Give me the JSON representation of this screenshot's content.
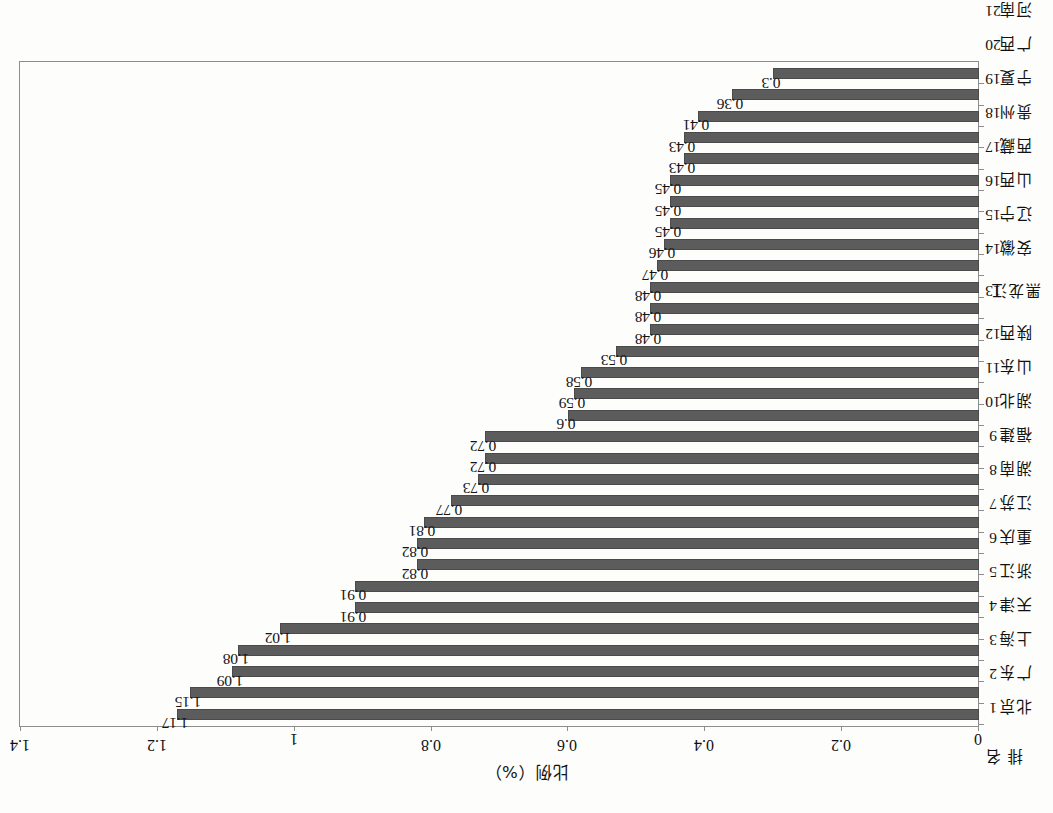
{
  "chart_data": {
    "type": "bar",
    "title": "",
    "xlabel": "",
    "ylabel": "比例（%）",
    "ylim": [
      0,
      1.4
    ],
    "ytick_labels": [
      "0",
      "0.2",
      "0.4",
      "0.6",
      "0.8",
      "1",
      "1.2",
      "1.4"
    ],
    "ytick_values": [
      0,
      0.2,
      0.4,
      0.6,
      0.8,
      1,
      1.2,
      1.4
    ],
    "grid": false,
    "legend": null,
    "orientation": "vertical-bars-on-rotated-page",
    "bar_color": "#5c5c5c",
    "rank_header": "排 名",
    "categories": [
      "北京",
      "广东",
      "上海",
      "天津",
      "浙江",
      "重庆",
      "江苏",
      "湖南",
      "福建",
      "湖北",
      "山东",
      "陕西",
      "黑龙江",
      "安徽",
      "辽宁",
      "山西",
      "西藏",
      "贵州",
      "宁夏",
      "广西",
      "河南",
      "内蒙古",
      "海南",
      "河北",
      "四川",
      "青海",
      "甘肃",
      "云南",
      "江西",
      "新疆",
      "吉林"
    ],
    "ranks": [
      "1",
      "2",
      "3",
      "4",
      "5",
      "6",
      "7",
      "8",
      "9",
      "10",
      "11",
      "12",
      "13",
      "14",
      "15",
      "16",
      "17",
      "18",
      "19",
      "20",
      "21",
      "22",
      "23",
      "24",
      "25",
      "26",
      "27",
      "28",
      "29",
      "30",
      "31"
    ],
    "values": [
      1.17,
      1.15,
      1.09,
      1.08,
      1.02,
      0.91,
      0.91,
      0.82,
      0.82,
      0.81,
      0.77,
      0.73,
      0.72,
      0.72,
      0.6,
      0.59,
      0.58,
      0.53,
      0.48,
      0.48,
      0.48,
      0.47,
      0.46,
      0.45,
      0.45,
      0.45,
      0.43,
      0.43,
      0.41,
      0.36,
      0.3
    ],
    "value_labels": [
      "1.17",
      "1.15",
      "1.09",
      "1.08",
      "1.02",
      "0.91",
      "0.91",
      "0.82",
      "0.82",
      "0.81",
      "0.77",
      "0.73",
      "0.72",
      "0.72",
      "0.6",
      "0.59",
      "0.58",
      "0.53",
      "0.48",
      "0.48",
      "0.48",
      "0.47",
      "0.46",
      "0.45",
      "0.45",
      "0.45",
      "0.43",
      "0.43",
      "0.41",
      "0.36",
      "0.3"
    ]
  }
}
